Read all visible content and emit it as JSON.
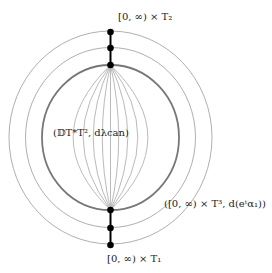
{
  "diagram": {
    "center": {
      "x": 110.5,
      "y": 137.5
    },
    "colors": {
      "thin_circle": "#9a9a9a",
      "thick_circle": "#777777",
      "meridian": "#a8a8a8",
      "axis": "#000000",
      "dot": "#000000"
    },
    "circles": [
      {
        "name": "outer-level",
        "rx": 101.5,
        "ry": 106.5,
        "width": 0.8
      },
      {
        "name": "middle-level",
        "rx": 85,
        "ry": 90,
        "width": 0.8
      },
      {
        "name": "boundary",
        "rx": 68.5,
        "ry": 72.5,
        "width": 1.8
      }
    ],
    "meridian_fractions": [
      -0.82,
      -0.6,
      -0.38,
      -0.18,
      0,
      0.18,
      0.38,
      0.6,
      0.82
    ],
    "top_points": [
      32,
      48,
      65
    ],
    "bottom_points": [
      210,
      228,
      245
    ],
    "labels": {
      "top": "[0, ∞) × T₂",
      "center": "(𝔻T*T², dλcan)",
      "right": "([0, ∞) × T³, d(eᵗα₁))",
      "bottom": "[0, ∞) × T₁"
    }
  }
}
